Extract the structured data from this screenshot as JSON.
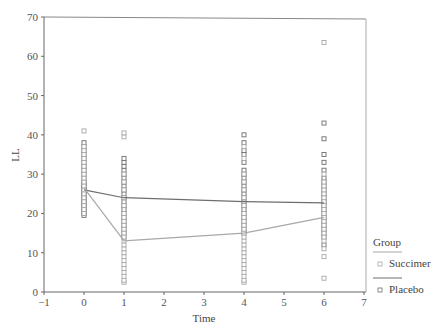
{
  "chart_data": {
    "type": "scatter",
    "title": "",
    "xlabel": "Time",
    "ylabel": "LL",
    "xlim": [
      -1,
      7
    ],
    "ylim": [
      0,
      70
    ],
    "xticks": [
      -1,
      0,
      1,
      2,
      3,
      4,
      5,
      6,
      7
    ],
    "yticks": [
      0,
      10,
      20,
      30,
      40,
      50,
      60,
      70
    ],
    "grid": false,
    "legend": {
      "title": "Group",
      "position": "right",
      "entries": [
        "Succimer",
        "Placebo"
      ]
    },
    "series": [
      {
        "name": "Placebo",
        "color": "#6e6e6e",
        "mean_line": {
          "x": [
            0,
            1,
            4,
            6
          ],
          "y": [
            26.0,
            24.0,
            23.0,
            22.7
          ]
        },
        "points": {
          "0": [
            19.5,
            20,
            20.5,
            21,
            21.5,
            22,
            22.5,
            23,
            23.5,
            24,
            24.5,
            25,
            25.5,
            26,
            26.5,
            27,
            27.5,
            28,
            29,
            30,
            31,
            32,
            33,
            34,
            35,
            36,
            37,
            38
          ],
          "1": [
            14,
            15,
            16,
            17,
            18,
            19,
            20,
            21,
            22,
            23,
            24,
            25,
            26,
            27,
            28,
            29,
            30,
            31,
            32,
            33,
            34
          ],
          "4": [
            15,
            16,
            17,
            18,
            19,
            20,
            21,
            22,
            23,
            24,
            25,
            26,
            27,
            28,
            29,
            30,
            31,
            33,
            35,
            36,
            38,
            40
          ],
          "6": [
            12,
            14,
            15,
            16,
            17,
            18,
            19,
            20,
            21,
            22,
            23,
            24,
            25,
            26,
            27,
            28,
            29,
            31,
            33,
            35,
            39,
            43
          ]
        }
      },
      {
        "name": "Succimer",
        "color": "#a8a8a8",
        "mean_line": {
          "x": [
            0,
            1,
            4,
            6
          ],
          "y": [
            26.5,
            13.0,
            15.0,
            19.0
          ]
        },
        "points": {
          "0": [
            20,
            21,
            22,
            23,
            24,
            25,
            26,
            27,
            28,
            29,
            30,
            31,
            32,
            33,
            34,
            35,
            36,
            37,
            41
          ],
          "1": [
            2.5,
            3,
            4,
            5,
            6,
            7,
            8,
            9,
            10,
            11,
            12,
            13,
            14,
            15,
            16,
            17,
            18,
            19,
            20,
            22,
            24,
            26,
            28,
            30,
            39.5,
            40.5
          ],
          "4": [
            2.5,
            3,
            4,
            5,
            6,
            7,
            8,
            9,
            10,
            11,
            12,
            13,
            14,
            15,
            16,
            17,
            18,
            19,
            20,
            22,
            24,
            26,
            28,
            30,
            34,
            37
          ],
          "6": [
            3.5,
            9,
            11,
            13,
            14,
            15,
            16,
            17,
            18,
            19,
            20,
            21,
            22,
            23,
            24,
            25,
            26,
            27,
            28,
            30,
            63.5
          ]
        }
      }
    ]
  }
}
